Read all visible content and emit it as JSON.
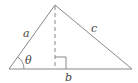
{
  "diagram": {
    "type": "triangle-with-altitude",
    "labels": {
      "side_a": "a",
      "side_c": "c",
      "base_b": "b",
      "angle": "θ"
    },
    "colors": {
      "stroke": "#888888",
      "text": "#444444",
      "background": "#ffffff"
    },
    "vertices": {
      "apex": [
        55,
        5
      ],
      "left": [
        9,
        69
      ],
      "right": [
        132,
        69
      ],
      "foot": [
        55,
        69
      ]
    }
  }
}
